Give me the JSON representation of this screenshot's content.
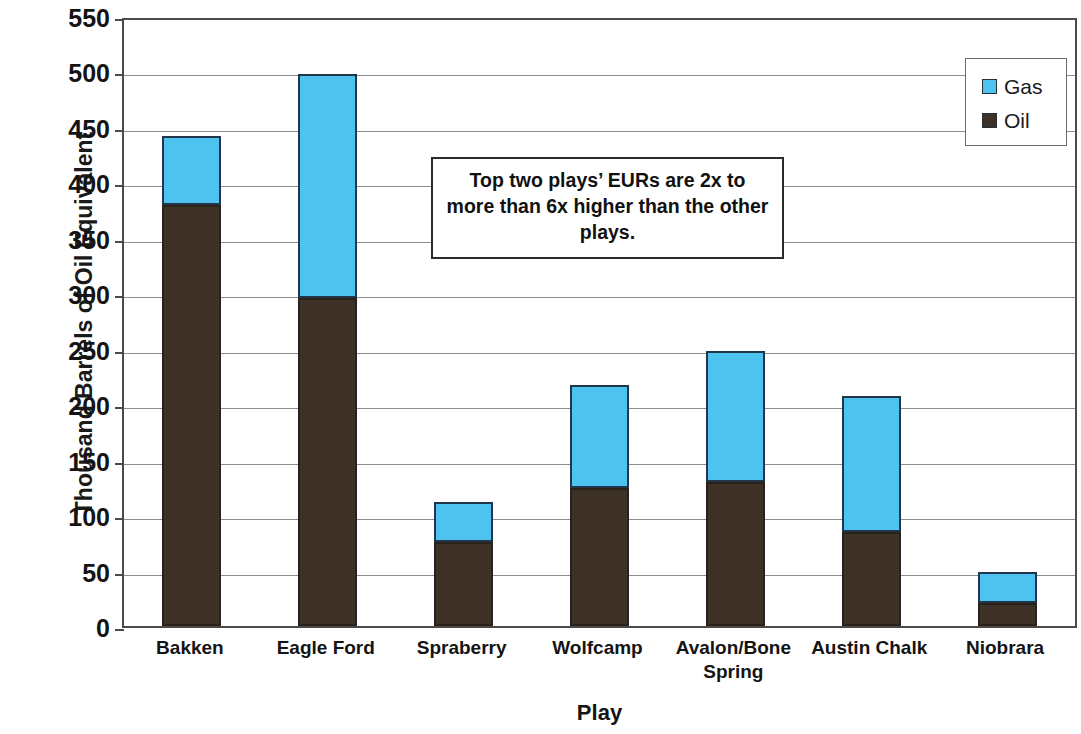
{
  "chart_data": {
    "type": "bar",
    "subtype": "stacked",
    "title": "",
    "xlabel": "Play",
    "ylabel": "Thousand Barrels of Oil Equivalent",
    "categories": [
      "Bakken",
      "Eagle Ford",
      "Spraberry",
      "Wolfcamp",
      "Avalon/Bone Spring",
      "Austin Chalk",
      "Niobrara"
    ],
    "series": [
      {
        "name": "Oil",
        "color": "#3E3226",
        "values": [
          380,
          296,
          76,
          124,
          130,
          85,
          21
        ]
      },
      {
        "name": "Gas",
        "color": "#4EC3F0",
        "values": [
          62,
          202,
          36,
          93,
          118,
          122,
          28
        ]
      }
    ],
    "totals": [
      442,
      498,
      112,
      217,
      248,
      207,
      49
    ],
    "ylim": [
      0,
      550
    ],
    "yticks": [
      0,
      50,
      100,
      150,
      200,
      250,
      300,
      350,
      400,
      450,
      500,
      550
    ],
    "ytick_labels": [
      "0",
      "50",
      "100",
      "150",
      "200",
      "250",
      "300",
      "350",
      "400",
      "450",
      "500",
      "550"
    ],
    "grid": true,
    "grid_axis": "y",
    "legend_position": "top-right",
    "annotations": [
      {
        "text": "Top two plays’ EURs are 2x to more than 6x higher than the other plays."
      }
    ]
  },
  "legend": {
    "entries": [
      {
        "label": "Gas",
        "color": "#4EC3F0"
      },
      {
        "label": "Oil",
        "color": "#3E3226"
      }
    ]
  },
  "axes": {
    "y_title": "Thousand Barrels of Oil Equivalent",
    "x_title": "Play"
  }
}
